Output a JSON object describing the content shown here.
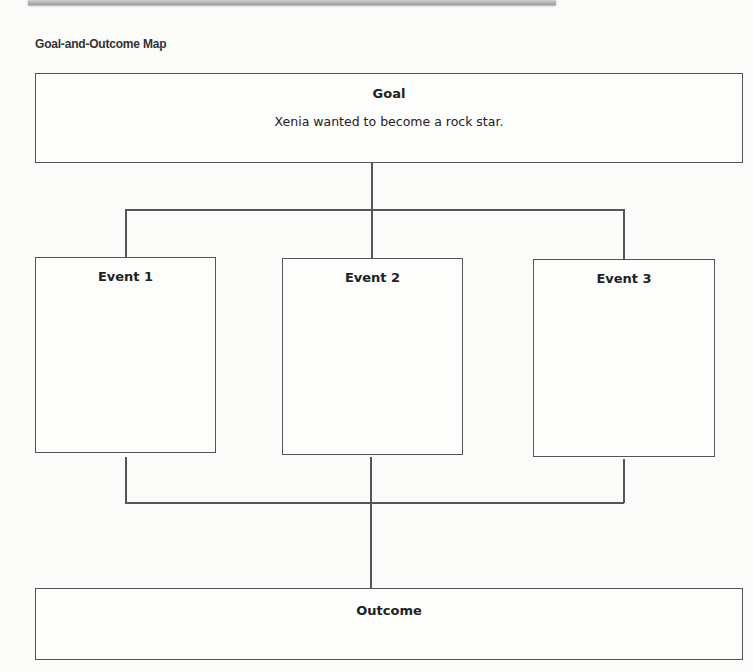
{
  "header": {
    "title": "Goal-and-Outcome Map"
  },
  "goal": {
    "label": "Goal",
    "text": "Xenia wanted to become a rock star."
  },
  "events": [
    {
      "label": "Event 1",
      "text": ""
    },
    {
      "label": "Event 2",
      "text": ""
    },
    {
      "label": "Event 3",
      "text": ""
    }
  ],
  "outcome": {
    "label": "Outcome",
    "text": ""
  },
  "colors": {
    "line": "#555555",
    "background": "#fbfbfa"
  }
}
